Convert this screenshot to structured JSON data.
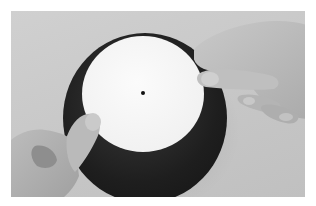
{
  "image": {
    "description": "Grayscale photograph of two hands holding a white circular paper disc with a small black center dot, placed on top of a larger dark circular disc, on a light gray surface",
    "colors": {
      "border": "#ffffff",
      "background": "#c8c8c8",
      "white_disc": "#f4f4f4",
      "dark_disc": "#1e1e1e",
      "center_dot": "#111111",
      "skin": "#bdbdbd"
    },
    "objects": [
      "white-disc",
      "center-dot",
      "dark-disc",
      "left-hand",
      "right-hand"
    ]
  }
}
